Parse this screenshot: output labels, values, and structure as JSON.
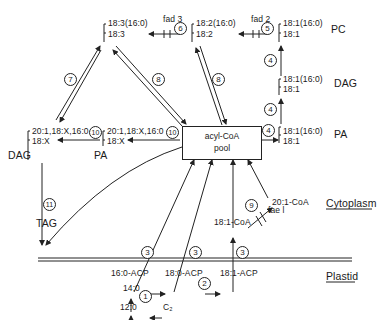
{
  "diagram": {
    "species": {
      "pc_upper": {
        "line1": "18:3(16:0)",
        "line2": "18:3"
      },
      "pc_mid": {
        "line1": "18:2(16:0)",
        "line2": "18:2"
      },
      "pc_right": {
        "line1": "18:1(16:0)",
        "line2": "18:1"
      },
      "dag_right": {
        "line1": "18:1(16:0)",
        "line2": "18:1"
      },
      "pa_right": {
        "line1": "18:1(16:0)",
        "line2": "18:1"
      },
      "dag_left": {
        "line1": "20:1,18:X,16:0",
        "line2": "18:X"
      },
      "pa_left": {
        "line1": "20:1,18:X,16:0",
        "line2": "18:X"
      }
    },
    "lipid_labels": {
      "pc": "PC",
      "dag_right": "DAG",
      "pa_right": "PA",
      "dag_left": "DAG",
      "pa_left": "PA",
      "tag": "TAG"
    },
    "pool": {
      "line1": "acyl-CoA",
      "line2": "pool"
    },
    "enzymes": {
      "fad3": "fad 3",
      "fad2": "fad 2",
      "fae1": "fae l"
    },
    "metabolites": {
      "c20_coa": "20:1-CoA",
      "c18_1_coa": "18:1-CoA",
      "c16_acp": "16:0-ACP",
      "c18_acp": "18:0-ACP",
      "c18_1_acp": "18:1-ACP",
      "c14": "14:0",
      "c12": "12:0",
      "c2": "C₂"
    },
    "compartments": {
      "cytoplasm": "Cytoplasm",
      "plastid": "Plastid"
    },
    "step_numbers": {
      "s1": "1",
      "s2": "2",
      "s3a": "3",
      "s3b": "3",
      "s3c": "3",
      "s4a": "4",
      "s4b": "4",
      "s4c": "4",
      "s5": "5",
      "s6": "6",
      "s7": "7",
      "s8a": "8",
      "s8b": "8",
      "s9": "9",
      "s10a": "10",
      "s10b": "10",
      "s11": "11"
    }
  }
}
